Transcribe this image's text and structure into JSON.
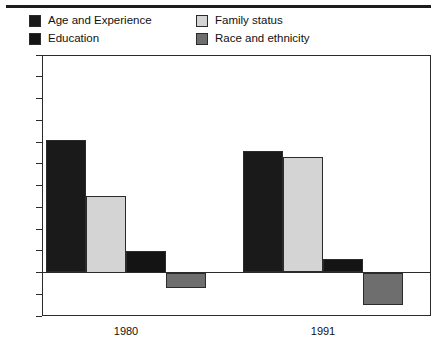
{
  "chart_data": {
    "type": "bar",
    "title": "",
    "subtitle": "",
    "xlabel": "",
    "ylabel": "",
    "categories": [
      "1980",
      "1991"
    ],
    "series": [
      {
        "name": "Age and Experience",
        "color": "#1a1a1a",
        "values": [
          0.61,
          0.56
        ]
      },
      {
        "name": "Family status",
        "color": "#d4d4d4",
        "values": [
          0.35,
          0.53
        ]
      },
      {
        "name": "Education",
        "color": "#141414",
        "values": [
          0.1,
          0.06
        ]
      },
      {
        "name": "Race and ethnicity",
        "color": "#6e6e6e",
        "values": [
          -0.07,
          -0.15
        ]
      }
    ],
    "ylim": [
      -0.2,
      1.0
    ],
    "ytick_values": [
      1,
      0.9,
      0.8,
      0.7,
      0.6,
      0.5,
      0.4,
      0.3,
      0.2,
      0.1,
      0,
      -0.1,
      -0.2
    ],
    "ytick_labels": [
      "1",
      ".9",
      ".8",
      ".7",
      ".6",
      ".5",
      ".4",
      ".3",
      ".2",
      ".1",
      "0",
      "−.1",
      "−.2"
    ],
    "grid": false,
    "legend_position": "top",
    "legend_order": [
      "Age and Experience",
      "Family status",
      "Education",
      "Race and ethnicity"
    ]
  },
  "legend": {
    "entries": [
      {
        "label": "Age and Experience",
        "color": "#1a1a1a"
      },
      {
        "label": "Education",
        "color": "#141414"
      },
      {
        "label": "Family status",
        "color": "#d4d4d4"
      },
      {
        "label": "Race and ethnicity",
        "color": "#6e6e6e"
      }
    ]
  }
}
